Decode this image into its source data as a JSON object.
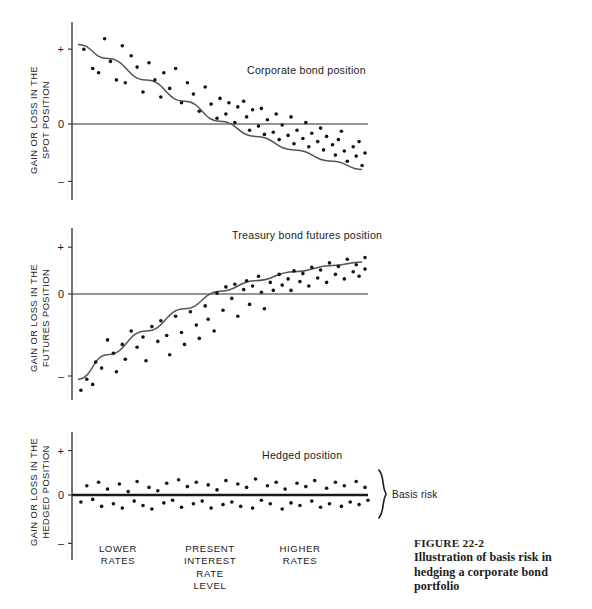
{
  "figure": {
    "caption_number": "FIGURE 22-2",
    "caption_text": "Illustration of basis risk in hedging a corporate bond portfolio"
  },
  "axis_categories": [
    {
      "id": "lower",
      "lines": [
        "LOWER",
        "RATES"
      ],
      "x": 118
    },
    {
      "id": "present",
      "lines": [
        "PRESENT",
        "INTEREST",
        "RATE",
        "LEVEL"
      ],
      "x": 210
    },
    {
      "id": "higher",
      "lines": [
        "HIGHER",
        "RATES"
      ],
      "x": 300
    }
  ],
  "annotations": {
    "basis_risk": "Basis risk"
  },
  "panels": [
    {
      "id": "spot",
      "title": "Corporate bond position",
      "ylabel_lines": [
        "GAIN OR LOSS IN THE",
        "SPOT POSITION"
      ],
      "ticks": [
        "+",
        "0",
        "–"
      ]
    },
    {
      "id": "futures",
      "title": "Treasury bond futures position",
      "ylabel_lines": [
        "GAIN OR LOSS IN THE",
        "FUTURES POSITION"
      ],
      "ticks": [
        "+",
        "0",
        "–"
      ]
    },
    {
      "id": "hedged",
      "title": "Hedged position",
      "ylabel_lines": [
        "GAIN OR LOSS IN THE",
        "HEDGED POSITION"
      ],
      "ticks": [
        "+",
        "0",
        "–"
      ]
    }
  ],
  "colors": {
    "ink": "#1a1a1a",
    "curve": "#555555",
    "dot": "#111111",
    "background": "#ffffff"
  },
  "chart_data": [
    {
      "type": "scatter",
      "id": "spot",
      "title": "Corporate bond position",
      "xlabel": "Interest rate level",
      "ylabel": "GAIN OR LOSS IN THE SPOT POSITION",
      "xlim": [
        0,
        100
      ],
      "ylim": [
        -1.35,
        1.35
      ],
      "yticks": [
        1,
        0,
        -1
      ],
      "ytick_labels": [
        "+",
        "0",
        "–"
      ],
      "grid": false,
      "legend": null,
      "trend": {
        "name": "spot price response",
        "description": "smooth downward-sloping concave curve from upper-left to lower-right",
        "points": [
          [
            2,
            1.12
          ],
          [
            12,
            0.92
          ],
          [
            25,
            0.62
          ],
          [
            38,
            0.32
          ],
          [
            50,
            0.04
          ],
          [
            62,
            -0.24
          ],
          [
            75,
            -0.5
          ],
          [
            88,
            -0.72
          ],
          [
            98,
            -0.88
          ]
        ]
      },
      "points": [
        [
          4,
          1.05
        ],
        [
          7,
          0.78
        ],
        [
          9,
          0.72
        ],
        [
          11,
          1.2
        ],
        [
          13,
          0.88
        ],
        [
          15,
          0.62
        ],
        [
          17,
          1.1
        ],
        [
          18,
          0.58
        ],
        [
          20,
          0.96
        ],
        [
          22,
          0.8
        ],
        [
          24,
          0.45
        ],
        [
          26,
          0.86
        ],
        [
          28,
          0.62
        ],
        [
          30,
          0.38
        ],
        [
          31,
          0.72
        ],
        [
          33,
          0.5
        ],
        [
          35,
          0.78
        ],
        [
          37,
          0.3
        ],
        [
          39,
          0.58
        ],
        [
          41,
          0.42
        ],
        [
          43,
          0.18
        ],
        [
          45,
          0.52
        ],
        [
          47,
          0.28
        ],
        [
          49,
          0.08
        ],
        [
          50,
          0.36
        ],
        [
          52,
          0.14
        ],
        [
          53,
          0.3
        ],
        [
          55,
          0.02
        ],
        [
          56,
          0.24
        ],
        [
          58,
          0.32
        ],
        [
          59,
          0.1
        ],
        [
          60,
          -0.12
        ],
        [
          61,
          0.2
        ],
        [
          63,
          -0.04
        ],
        [
          64,
          0.22
        ],
        [
          65,
          -0.2
        ],
        [
          66,
          0.06
        ],
        [
          68,
          -0.16
        ],
        [
          69,
          0.14
        ],
        [
          70,
          -0.3
        ],
        [
          71,
          -0.02
        ],
        [
          73,
          -0.22
        ],
        [
          74,
          0.1
        ],
        [
          75,
          -0.38
        ],
        [
          76,
          -0.12
        ],
        [
          78,
          -0.28
        ],
        [
          79,
          0.02
        ],
        [
          80,
          -0.44
        ],
        [
          81,
          -0.18
        ],
        [
          83,
          -0.34
        ],
        [
          84,
          -0.08
        ],
        [
          85,
          -0.5
        ],
        [
          86,
          -0.24
        ],
        [
          88,
          -0.4
        ],
        [
          89,
          -0.6
        ],
        [
          90,
          -0.3
        ],
        [
          91,
          -0.14
        ],
        [
          92,
          -0.52
        ],
        [
          93,
          -0.72
        ],
        [
          95,
          -0.44
        ],
        [
          96,
          -0.62
        ],
        [
          97,
          -0.34
        ],
        [
          98,
          -0.8
        ],
        [
          99,
          -0.56
        ]
      ]
    },
    {
      "type": "scatter",
      "id": "futures",
      "title": "Treasury bond futures position",
      "xlabel": "Interest rate level",
      "ylabel": "GAIN OR LOSS IN THE FUTURES POSITION",
      "xlim": [
        0,
        100
      ],
      "ylim": [
        -1.35,
        1.35
      ],
      "yticks": [
        1,
        0,
        -1
      ],
      "ytick_labels": [
        "+",
        "0",
        "–"
      ],
      "grid": false,
      "legend": null,
      "trend": {
        "name": "futures price response",
        "description": "smooth upward-sloping concave curve from lower-left to upper-right",
        "points": [
          [
            2,
            -1.15
          ],
          [
            12,
            -0.82
          ],
          [
            25,
            -0.5
          ],
          [
            38,
            -0.2
          ],
          [
            50,
            0.06
          ],
          [
            62,
            0.3
          ],
          [
            75,
            0.5
          ],
          [
            88,
            0.64
          ],
          [
            98,
            0.72
          ]
        ]
      },
      "points": [
        [
          3,
          -1.3
        ],
        [
          5,
          -1.15
        ],
        [
          7,
          -1.22
        ],
        [
          8,
          -0.92
        ],
        [
          10,
          -1.0
        ],
        [
          12,
          -0.62
        ],
        [
          14,
          -0.8
        ],
        [
          15,
          -1.05
        ],
        [
          17,
          -0.68
        ],
        [
          18,
          -0.88
        ],
        [
          20,
          -0.5
        ],
        [
          22,
          -0.72
        ],
        [
          24,
          -0.58
        ],
        [
          25,
          -0.9
        ],
        [
          27,
          -0.44
        ],
        [
          29,
          -0.64
        ],
        [
          30,
          -0.36
        ],
        [
          32,
          -0.56
        ],
        [
          33,
          -0.82
        ],
        [
          35,
          -0.3
        ],
        [
          37,
          -0.52
        ],
        [
          38,
          -0.68
        ],
        [
          40,
          -0.24
        ],
        [
          42,
          -0.42
        ],
        [
          43,
          -0.6
        ],
        [
          45,
          -0.16
        ],
        [
          46,
          -0.34
        ],
        [
          48,
          -0.5
        ],
        [
          49,
          0.02
        ],
        [
          51,
          -0.22
        ],
        [
          52,
          0.16
        ],
        [
          54,
          -0.06
        ],
        [
          55,
          0.22
        ],
        [
          56,
          -0.3
        ],
        [
          58,
          0.1
        ],
        [
          59,
          0.3
        ],
        [
          60,
          -0.14
        ],
        [
          61,
          0.18
        ],
        [
          63,
          0.4
        ],
        [
          64,
          0.04
        ],
        [
          65,
          -0.2
        ],
        [
          67,
          0.26
        ],
        [
          68,
          0.08
        ],
        [
          70,
          0.44
        ],
        [
          71,
          0.2
        ],
        [
          73,
          0.34
        ],
        [
          74,
          0.08
        ],
        [
          75,
          0.52
        ],
        [
          77,
          0.28
        ],
        [
          78,
          0.46
        ],
        [
          80,
          0.18
        ],
        [
          81,
          0.6
        ],
        [
          83,
          0.36
        ],
        [
          84,
          0.54
        ],
        [
          86,
          0.26
        ],
        [
          87,
          0.7
        ],
        [
          89,
          0.44
        ],
        [
          90,
          0.62
        ],
        [
          92,
          0.34
        ],
        [
          93,
          0.78
        ],
        [
          95,
          0.5
        ],
        [
          96,
          0.66
        ],
        [
          97,
          0.4
        ],
        [
          99,
          0.82
        ],
        [
          99,
          0.56
        ]
      ]
    },
    {
      "type": "scatter",
      "id": "hedged",
      "title": "Hedged position",
      "xlabel": "Interest rate level",
      "ylabel": "GAIN OR LOSS IN THE HEDGED POSITION",
      "xlim": [
        0,
        100
      ],
      "ylim": [
        -1.35,
        1.35
      ],
      "yticks": [
        1,
        0,
        -1
      ],
      "ytick_labels": [
        "+",
        "0",
        "–"
      ],
      "grid": false,
      "legend": null,
      "annotation": "Basis risk",
      "trend": {
        "name": "hedged net position",
        "description": "flat horizontal line at zero; residual scatter forms the basis risk band",
        "points": [
          [
            0,
            0
          ],
          [
            100,
            0
          ]
        ]
      },
      "points": [
        [
          3,
          -0.16
        ],
        [
          5,
          0.22
        ],
        [
          7,
          -0.1
        ],
        [
          9,
          0.3
        ],
        [
          10,
          -0.26
        ],
        [
          12,
          0.14
        ],
        [
          14,
          -0.2
        ],
        [
          16,
          0.26
        ],
        [
          17,
          -0.3
        ],
        [
          19,
          0.08
        ],
        [
          21,
          -0.14
        ],
        [
          22,
          0.32
        ],
        [
          24,
          -0.24
        ],
        [
          26,
          0.18
        ],
        [
          27,
          -0.32
        ],
        [
          29,
          0.1
        ],
        [
          31,
          -0.18
        ],
        [
          32,
          0.28
        ],
        [
          34,
          -0.12
        ],
        [
          36,
          0.36
        ],
        [
          37,
          -0.28
        ],
        [
          39,
          0.2
        ],
        [
          41,
          -0.2
        ],
        [
          42,
          0.3
        ],
        [
          44,
          -0.14
        ],
        [
          46,
          0.24
        ],
        [
          47,
          -0.3
        ],
        [
          49,
          0.12
        ],
        [
          51,
          -0.22
        ],
        [
          52,
          0.34
        ],
        [
          54,
          -0.16
        ],
        [
          56,
          0.26
        ],
        [
          57,
          -0.26
        ],
        [
          59,
          0.18
        ],
        [
          61,
          -0.3
        ],
        [
          62,
          0.38
        ],
        [
          64,
          -0.12
        ],
        [
          66,
          0.22
        ],
        [
          67,
          -0.2
        ],
        [
          69,
          0.3
        ],
        [
          71,
          -0.32
        ],
        [
          72,
          0.14
        ],
        [
          74,
          -0.18
        ],
        [
          76,
          0.28
        ],
        [
          77,
          -0.24
        ],
        [
          79,
          0.2
        ],
        [
          81,
          -0.14
        ],
        [
          82,
          0.34
        ],
        [
          84,
          -0.28
        ],
        [
          86,
          0.16
        ],
        [
          87,
          -0.2
        ],
        [
          89,
          0.3
        ],
        [
          91,
          -0.26
        ],
        [
          92,
          0.22
        ],
        [
          94,
          -0.16
        ],
        [
          96,
          0.32
        ],
        [
          97,
          -0.22
        ],
        [
          99,
          0.18
        ],
        [
          100,
          -0.12
        ]
      ]
    }
  ]
}
